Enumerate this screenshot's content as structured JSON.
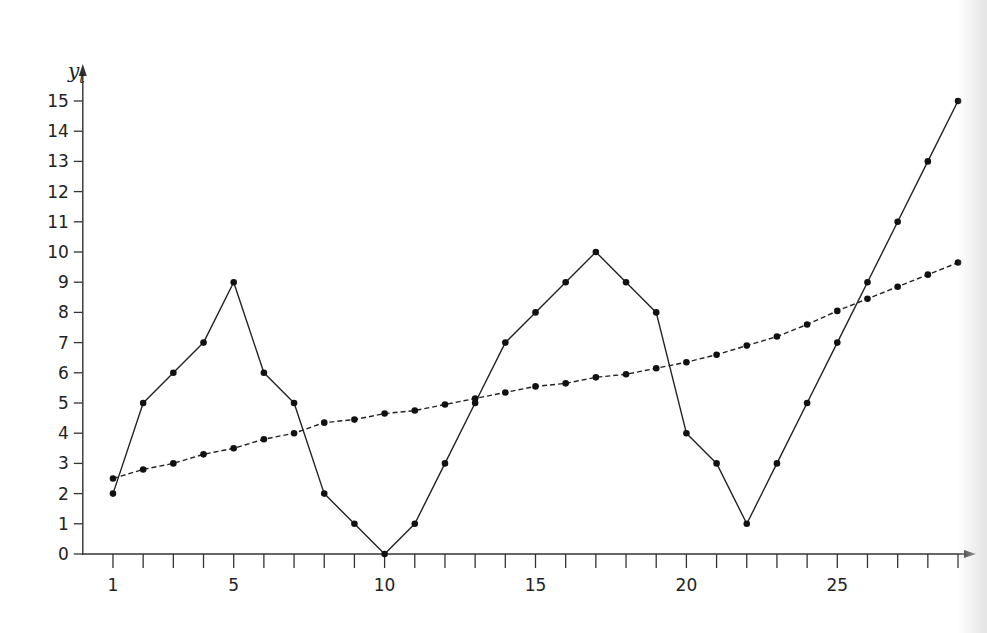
{
  "chart_data": {
    "type": "line",
    "title": "",
    "xlabel": "",
    "ylabel": "y_t",
    "ylabel_display": {
      "main": "y",
      "sub": "t"
    },
    "x": [
      1,
      2,
      3,
      4,
      5,
      6,
      7,
      8,
      9,
      10,
      11,
      12,
      13,
      14,
      15,
      16,
      17,
      18,
      19,
      20,
      21,
      22,
      23,
      24,
      25,
      26,
      27,
      28,
      29
    ],
    "x_tick_labels": [
      {
        "value": 1,
        "label": "1"
      },
      {
        "value": 5,
        "label": "5"
      },
      {
        "value": 10,
        "label": "10"
      },
      {
        "value": 15,
        "label": "15"
      },
      {
        "value": 20,
        "label": "20"
      },
      {
        "value": 25,
        "label": "25"
      }
    ],
    "y_ticks": [
      0,
      1,
      2,
      3,
      4,
      5,
      6,
      7,
      8,
      9,
      10,
      11,
      12,
      13,
      14,
      15
    ],
    "xlim": [
      0,
      31
    ],
    "ylim": [
      0,
      15.8
    ],
    "grid": false,
    "legend": null,
    "series": [
      {
        "name": "observed",
        "style": "solid",
        "marker": "dot",
        "color": "#222222",
        "values": [
          2,
          5,
          6,
          7,
          9,
          6,
          5,
          2,
          1,
          0,
          1,
          3,
          5,
          7,
          8,
          9,
          10,
          9,
          8,
          4,
          3,
          1,
          3,
          5,
          7,
          9,
          11,
          13,
          15
        ]
      },
      {
        "name": "trend",
        "style": "dashed",
        "marker": "dot",
        "color": "#222222",
        "values": [
          2.5,
          2.8,
          3.0,
          3.3,
          3.5,
          3.8,
          4.0,
          4.35,
          4.45,
          4.65,
          4.75,
          4.95,
          5.15,
          5.35,
          5.55,
          5.65,
          5.85,
          5.95,
          6.15,
          6.35,
          6.6,
          6.9,
          7.2,
          7.6,
          8.05,
          8.45,
          8.85,
          9.25,
          9.65
        ]
      }
    ]
  }
}
